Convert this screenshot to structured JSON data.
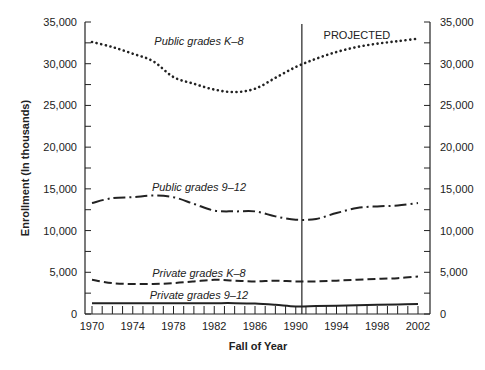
{
  "chart_data": {
    "type": "line",
    "title": "",
    "xlabel": "Fall of Year",
    "ylabel": "Enrollment (In thousands)",
    "xlim": [
      1970,
      2002
    ],
    "ylim": [
      0,
      35000
    ],
    "x_ticks": [
      1970,
      1974,
      1978,
      1982,
      1986,
      1990,
      1994,
      1998,
      2002
    ],
    "x_tick_labels": [
      "1970",
      "1974",
      "1978",
      "1982",
      "1986",
      "1990",
      "1994",
      "1998",
      "2002"
    ],
    "x_minor_tick_step": 1,
    "y_ticks": [
      0,
      5000,
      10000,
      15000,
      20000,
      25000,
      30000,
      35000
    ],
    "y_tick_labels": [
      "0",
      "5,000",
      "10,000",
      "15,000",
      "20,000",
      "25,000",
      "30,000",
      "35,000"
    ],
    "y_minor_tick_step": 2500,
    "right_axis_mirrors_left": true,
    "grid": false,
    "legend": "inline labels",
    "annotations": [
      {
        "text": "PROJECTED",
        "x": 1996,
        "y": 33500
      }
    ],
    "projection_start_year": 1990.6,
    "series": [
      {
        "name": "Public grades K–8",
        "style": "dotted",
        "label_position": {
          "x": 1980.5,
          "y": 32700
        },
        "x": [
          1970,
          1972,
          1974,
          1976,
          1978,
          1980,
          1982,
          1984,
          1986,
          1988,
          1990,
          1992,
          1994,
          1996,
          1998,
          2000,
          2002
        ],
        "values": [
          32600,
          32000,
          31200,
          30300,
          28400,
          27600,
          26900,
          26600,
          27000,
          28300,
          29600,
          30600,
          31400,
          32000,
          32400,
          32700,
          33000
        ]
      },
      {
        "name": "Public grades 9–12",
        "style": "dash-dot",
        "label_position": {
          "x": 1980.5,
          "y": 15200
        },
        "x": [
          1970,
          1972,
          1974,
          1976,
          1978,
          1980,
          1982,
          1984,
          1986,
          1988,
          1990,
          1992,
          1994,
          1996,
          1998,
          2000,
          2002
        ],
        "values": [
          13300,
          13900,
          14000,
          14200,
          14000,
          13200,
          12400,
          12300,
          12300,
          11700,
          11300,
          11400,
          12100,
          12700,
          12900,
          13000,
          13300
        ]
      },
      {
        "name": "Private grades K–8",
        "style": "dashed",
        "label_position": {
          "x": 1980.5,
          "y": 4900
        },
        "x": [
          1970,
          1972,
          1974,
          1976,
          1978,
          1980,
          1982,
          1984,
          1986,
          1988,
          1990,
          1992,
          1994,
          1996,
          1998,
          2000,
          2002
        ],
        "values": [
          4100,
          3700,
          3600,
          3600,
          3700,
          3900,
          4100,
          4000,
          3900,
          4000,
          3900,
          3900,
          4000,
          4100,
          4200,
          4300,
          4500
        ]
      },
      {
        "name": "Private grades 9–12",
        "style": "solid",
        "label_position": {
          "x": 1980.5,
          "y": 2250
        },
        "x": [
          1970,
          1972,
          1974,
          1976,
          1978,
          1980,
          1982,
          1984,
          1986,
          1988,
          1990,
          1992,
          1994,
          1996,
          1998,
          2000,
          2002
        ],
        "values": [
          1300,
          1300,
          1300,
          1300,
          1300,
          1300,
          1300,
          1300,
          1250,
          1100,
          900,
          950,
          1000,
          1050,
          1100,
          1150,
          1200
        ]
      }
    ]
  }
}
